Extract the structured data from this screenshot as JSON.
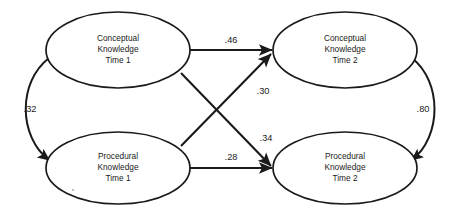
{
  "diagram": {
    "type": "cross-lagged-panel-path-diagram",
    "background_color": "#ffffff",
    "line_color": "#1a1a1a",
    "nodes": [
      {
        "id": "ck1",
        "name": "conceptual-knowledge-time-1",
        "line1": "Conceptual",
        "line2": "Knowledge",
        "line3": "Time 1",
        "cx": 118,
        "cy": 50,
        "rx": 72,
        "ry": 38
      },
      {
        "id": "ck2",
        "name": "conceptual-knowledge-time-2",
        "line1": "Conceptual",
        "line2": "Knowledge",
        "line3": "Time 2",
        "cx": 345,
        "cy": 50,
        "rx": 72,
        "ry": 38
      },
      {
        "id": "pk1",
        "name": "procedural-knowledge-time-1",
        "line1": "Procedural",
        "line2": "Knowledge",
        "line3": "Time 1",
        "cx": 118,
        "cy": 168,
        "rx": 72,
        "ry": 36
      },
      {
        "id": "pk2",
        "name": "procedural-knowledge-time-2",
        "line1": "Procedural",
        "line2": "Knowledge",
        "line3": "Time 2",
        "cx": 345,
        "cy": 168,
        "rx": 72,
        "ry": 36
      }
    ],
    "paths": [
      {
        "id": "ck1-to-ck2",
        "name": "path-autoregressive-conceptual",
        "from": "ck1",
        "to": "ck2",
        "coefficient": ".46",
        "label_x": 231,
        "label_y": 41,
        "style": "straight",
        "arrow": "single"
      },
      {
        "id": "pk1-to-ck2",
        "name": "path-crosslag-procedural-to-conceptual",
        "from": "pk1",
        "to": "ck2",
        "coefficient": ".30",
        "label_x": 263,
        "label_y": 92,
        "style": "diagonal",
        "arrow": "single"
      },
      {
        "id": "ck1-to-pk2",
        "name": "path-crosslag-conceptual-to-procedural",
        "from": "ck1",
        "to": "pk2",
        "coefficient": ".34",
        "label_x": 266,
        "label_y": 139,
        "style": "diagonal",
        "arrow": "single"
      },
      {
        "id": "pk1-to-pk2",
        "name": "path-autoregressive-procedural",
        "from": "pk1",
        "to": "pk2",
        "coefficient": ".28",
        "label_x": 231,
        "label_y": 158,
        "style": "straight",
        "arrow": "single"
      },
      {
        "id": "ck1-pk1-corr",
        "name": "correlation-time-1",
        "from": "ck1",
        "to": "pk1",
        "coefficient": ".32",
        "label_x": 30,
        "label_y": 110,
        "style": "curved",
        "arrow": "double"
      },
      {
        "id": "ck2-pk2-corr",
        "name": "correlation-time-2",
        "from": "ck2",
        "to": "pk2",
        "coefficient": ".80",
        "label_x": 423,
        "label_y": 110,
        "style": "curved",
        "arrow": "double"
      }
    ]
  }
}
